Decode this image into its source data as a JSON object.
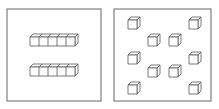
{
  "diagram": {
    "title": "",
    "stroke_color": "#555555",
    "panel_stroke": "#666666",
    "background": "#ffffff",
    "cube_size": 9,
    "cube_depth": 3,
    "panels": [
      {
        "name": "tens-panel",
        "x": 7,
        "y": 9,
        "w": 94,
        "h": 92,
        "rods": [
          {
            "x": 30,
            "y": 37,
            "units": 5
          },
          {
            "x": 30,
            "y": 67,
            "units": 5
          }
        ],
        "cubes": []
      },
      {
        "name": "ones-panel",
        "x": 114,
        "y": 9,
        "w": 97,
        "h": 92,
        "rods": [],
        "cubes": [
          {
            "x": 128,
            "y": 20
          },
          {
            "x": 189,
            "y": 20
          },
          {
            "x": 148,
            "y": 37
          },
          {
            "x": 169,
            "y": 37
          },
          {
            "x": 128,
            "y": 55
          },
          {
            "x": 189,
            "y": 55
          },
          {
            "x": 148,
            "y": 68
          },
          {
            "x": 169,
            "y": 68
          },
          {
            "x": 128,
            "y": 85
          },
          {
            "x": 189,
            "y": 85
          }
        ]
      }
    ]
  }
}
